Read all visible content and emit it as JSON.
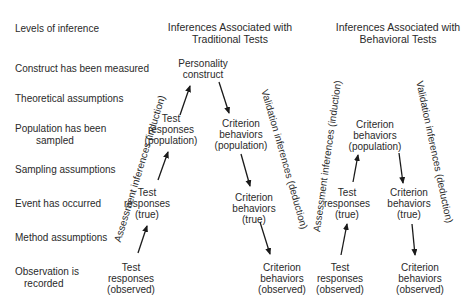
{
  "levels": {
    "header": "Levels of inference",
    "items": [
      {
        "text": "Construct has been measured",
        "line2": ""
      },
      {
        "text": "Theoretical assumptions",
        "line2": ""
      },
      {
        "text": "Population has been",
        "line2": "sampled"
      },
      {
        "text": "Sampling assumptions",
        "line2": ""
      },
      {
        "text": "Event has occurred",
        "line2": ""
      },
      {
        "text": "Method assumptions",
        "line2": ""
      },
      {
        "text": "Observation is",
        "line2": "recorded"
      }
    ]
  },
  "traditional": {
    "header_line1": "Inferences Associated with",
    "header_line2": "Traditional Tests",
    "construct": {
      "line1": "Personality",
      "line2": "construct"
    },
    "test_population": {
      "line1": "Test",
      "line2": "responses",
      "line3": "(population)"
    },
    "test_true": {
      "line1": "Test",
      "line2": "responses",
      "line3": "(true)"
    },
    "test_observed": {
      "line1": "Test",
      "line2": "responses",
      "line3": "(observed)"
    },
    "crit_population": {
      "line1": "Criterion",
      "line2": "behaviors",
      "line3": "(population)"
    },
    "crit_true": {
      "line1": "Criterion",
      "line2": "behaviors",
      "line3": "(true)"
    },
    "crit_observed": {
      "line1": "Criterion",
      "line2": "behaviors",
      "line3": "(observed)"
    },
    "assessment_label": "Assessment inferences (induction)",
    "validation_label": "Validation inferences (deduction)"
  },
  "behavioral": {
    "header_line1": "Inferences Associated with",
    "header_line2": "Behavioral Tests",
    "crit_population": {
      "line1": "Criterion",
      "line2": "behaviors",
      "line3": "(population)"
    },
    "test_true": {
      "line1": "Test",
      "line2": "responses",
      "line3": "(true)"
    },
    "test_observed": {
      "line1": "Test",
      "line2": "responses",
      "line3": "(observed)"
    },
    "crit_true": {
      "line1": "Criterion",
      "line2": "behaviors",
      "line3": "(true)"
    },
    "crit_observed": {
      "line1": "Criterion",
      "line2": "behaviors",
      "line3": "(observed)"
    },
    "assessment_label": "Assessment inferences (induction)",
    "validation_label": "Validation inferences (deduction)"
  }
}
